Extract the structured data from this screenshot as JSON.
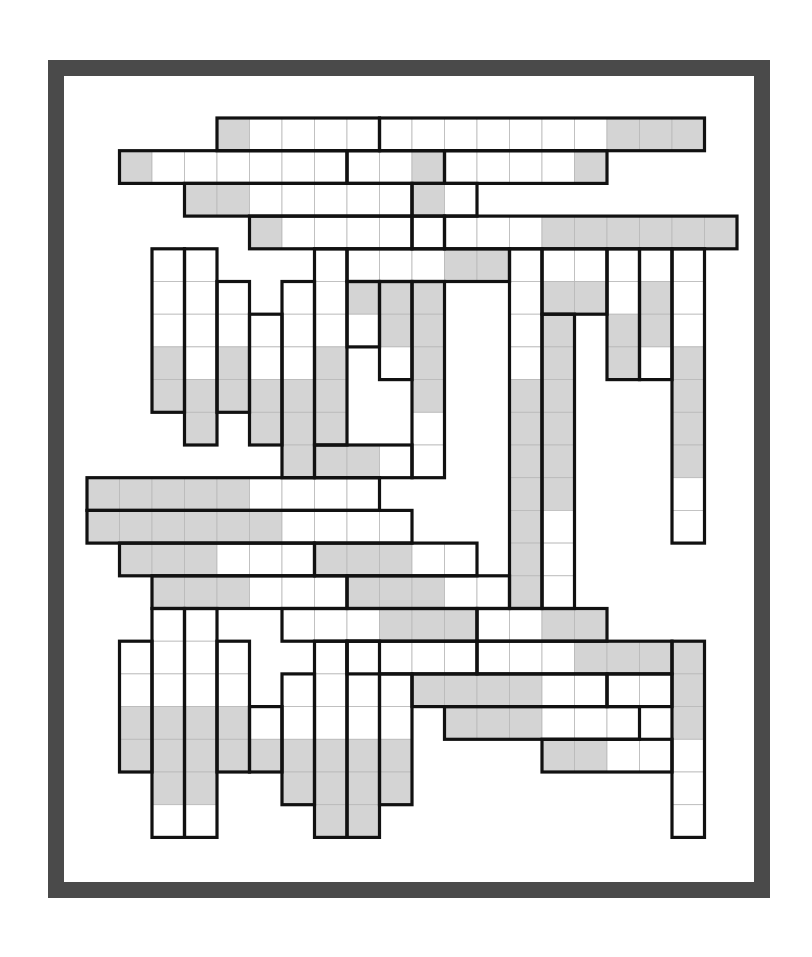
{
  "puzzle": {
    "title": "",
    "grid": {
      "origin_x": 87,
      "origin_y": 118,
      "cell_w": 32.5,
      "cell_h": 32.7
    },
    "colors": {
      "frame": "#4a4a4a",
      "shaded": "#d4d4d4",
      "empty": "#ffffff",
      "outline": "#111111",
      "gridline": "#b9b9b9"
    },
    "blocks": [
      {
        "c": 4,
        "r": 0,
        "w": 5,
        "h": 1,
        "shaded": [
          [
            4,
            0
          ]
        ]
      },
      {
        "c": 9,
        "r": 0,
        "w": 10,
        "h": 1,
        "shaded": [
          [
            16,
            0
          ],
          [
            17,
            0
          ],
          [
            18,
            0
          ]
        ]
      },
      {
        "c": 1,
        "r": 1,
        "w": 7,
        "h": 1,
        "shaded": [
          [
            1,
            1
          ]
        ]
      },
      {
        "c": 8,
        "r": 1,
        "w": 3,
        "h": 1,
        "shaded": [
          [
            10,
            1
          ]
        ]
      },
      {
        "c": 11,
        "r": 1,
        "w": 5,
        "h": 1,
        "shaded": [
          [
            15,
            1
          ]
        ]
      },
      {
        "c": 3,
        "r": 2,
        "w": 7,
        "h": 1,
        "shaded": [
          [
            3,
            2
          ],
          [
            4,
            2
          ]
        ]
      },
      {
        "c": 10,
        "r": 2,
        "w": 2,
        "h": 1,
        "shaded": [
          [
            10,
            2
          ]
        ]
      },
      {
        "c": 5,
        "r": 3,
        "w": 5,
        "h": 1,
        "shaded": [
          [
            5,
            3
          ]
        ]
      },
      {
        "c": 10,
        "r": 3,
        "w": 1,
        "h": 1,
        "shaded": []
      },
      {
        "c": 11,
        "r": 3,
        "w": 9,
        "h": 1,
        "shaded": [
          [
            14,
            3
          ],
          [
            15,
            3
          ],
          [
            16,
            3
          ],
          [
            17,
            3
          ],
          [
            18,
            3
          ],
          [
            19,
            3
          ]
        ]
      },
      {
        "c": 2,
        "r": 4,
        "w": 1,
        "h": 5,
        "shaded": [
          [
            2,
            7
          ],
          [
            2,
            8
          ]
        ]
      },
      {
        "c": 3,
        "r": 4,
        "w": 1,
        "h": 6,
        "shaded": [
          [
            3,
            8
          ],
          [
            3,
            9
          ]
        ]
      },
      {
        "c": 4,
        "r": 5,
        "w": 1,
        "h": 4,
        "shaded": [
          [
            4,
            7
          ],
          [
            4,
            8
          ]
        ]
      },
      {
        "c": 5,
        "r": 6,
        "w": 1,
        "h": 4,
        "shaded": [
          [
            5,
            8
          ],
          [
            5,
            9
          ]
        ]
      },
      {
        "c": 6,
        "r": 5,
        "w": 1,
        "h": 6,
        "shaded": [
          [
            6,
            8
          ],
          [
            6,
            9
          ],
          [
            6,
            10
          ]
        ]
      },
      {
        "c": 7,
        "r": 4,
        "w": 1,
        "h": 6,
        "shaded": [
          [
            7,
            7
          ],
          [
            7,
            8
          ],
          [
            7,
            9
          ]
        ]
      },
      {
        "c": 8,
        "r": 4,
        "w": 5,
        "h": 1,
        "shaded": [
          [
            11,
            4
          ],
          [
            12,
            4
          ]
        ]
      },
      {
        "c": 8,
        "r": 5,
        "w": 1,
        "h": 2,
        "shaded": [
          [
            8,
            5
          ]
        ]
      },
      {
        "c": 9,
        "r": 5,
        "w": 1,
        "h": 3,
        "shaded": [
          [
            9,
            5
          ],
          [
            9,
            6
          ]
        ]
      },
      {
        "c": 10,
        "r": 5,
        "w": 1,
        "h": 6,
        "shaded": [
          [
            10,
            5
          ],
          [
            10,
            6
          ],
          [
            10,
            7
          ],
          [
            10,
            8
          ]
        ]
      },
      {
        "c": 7,
        "r": 10,
        "w": 3,
        "h": 1,
        "shaded": [
          [
            7,
            10
          ],
          [
            8,
            10
          ]
        ]
      },
      {
        "c": 13,
        "r": 4,
        "w": 1,
        "h": 11,
        "shaded": [
          [
            13,
            8
          ],
          [
            13,
            9
          ],
          [
            13,
            10
          ],
          [
            13,
            11
          ],
          [
            13,
            12
          ],
          [
            13,
            13
          ],
          [
            13,
            14
          ]
        ]
      },
      {
        "c": 14,
        "r": 4,
        "w": 2,
        "h": 2,
        "shaded": [
          [
            14,
            5
          ],
          [
            15,
            5
          ]
        ]
      },
      {
        "c": 14,
        "r": 6,
        "w": 1,
        "h": 9,
        "shaded": [
          [
            14,
            6
          ],
          [
            14,
            7
          ],
          [
            14,
            8
          ],
          [
            14,
            9
          ],
          [
            14,
            10
          ],
          [
            14,
            11
          ]
        ]
      },
      {
        "c": 16,
        "r": 4,
        "w": 1,
        "h": 4,
        "shaded": [
          [
            16,
            6
          ],
          [
            16,
            7
          ]
        ]
      },
      {
        "c": 17,
        "r": 4,
        "w": 1,
        "h": 4,
        "shaded": [
          [
            17,
            5
          ],
          [
            17,
            6
          ]
        ]
      },
      {
        "c": 18,
        "r": 4,
        "w": 1,
        "h": 9,
        "shaded": [
          [
            18,
            7
          ],
          [
            18,
            8
          ],
          [
            18,
            9
          ],
          [
            18,
            10
          ]
        ]
      },
      {
        "c": 0,
        "r": 11,
        "w": 9,
        "h": 1,
        "shaded": [
          [
            0,
            11
          ],
          [
            1,
            11
          ],
          [
            2,
            11
          ],
          [
            3,
            11
          ],
          [
            4,
            11
          ]
        ]
      },
      {
        "c": 0,
        "r": 12,
        "w": 10,
        "h": 1,
        "shaded": [
          [
            0,
            12
          ],
          [
            1,
            12
          ],
          [
            2,
            12
          ],
          [
            3,
            12
          ],
          [
            4,
            12
          ],
          [
            5,
            12
          ]
        ]
      },
      {
        "c": 1,
        "r": 13,
        "w": 6,
        "h": 1,
        "shaded": [
          [
            1,
            13
          ],
          [
            2,
            13
          ],
          [
            3,
            13
          ]
        ]
      },
      {
        "c": 7,
        "r": 13,
        "w": 5,
        "h": 1,
        "shaded": [
          [
            7,
            13
          ],
          [
            8,
            13
          ],
          [
            9,
            13
          ]
        ]
      },
      {
        "c": 2,
        "r": 14,
        "w": 6,
        "h": 1,
        "shaded": [
          [
            2,
            14
          ],
          [
            3,
            14
          ],
          [
            4,
            14
          ]
        ]
      },
      {
        "c": 8,
        "r": 14,
        "w": 5,
        "h": 1,
        "shaded": [
          [
            8,
            14
          ],
          [
            9,
            14
          ],
          [
            10,
            14
          ]
        ]
      },
      {
        "c": 6,
        "r": 15,
        "w": 6,
        "h": 1,
        "shaded": [
          [
            9,
            15
          ],
          [
            10,
            15
          ],
          [
            11,
            15
          ]
        ]
      },
      {
        "c": 12,
        "r": 15,
        "w": 4,
        "h": 1,
        "shaded": [
          [
            14,
            15
          ],
          [
            15,
            15
          ]
        ]
      },
      {
        "c": 8,
        "r": 16,
        "w": 4,
        "h": 1,
        "shaded": []
      },
      {
        "c": 12,
        "r": 16,
        "w": 6,
        "h": 1,
        "shaded": [
          [
            15,
            16
          ],
          [
            16,
            16
          ],
          [
            17,
            16
          ]
        ]
      },
      {
        "c": 18,
        "r": 16,
        "w": 1,
        "h": 6,
        "shaded": [
          [
            18,
            16
          ],
          [
            18,
            17
          ],
          [
            18,
            18
          ]
        ]
      },
      {
        "c": 10,
        "r": 17,
        "w": 6,
        "h": 1,
        "shaded": [
          [
            10,
            17
          ],
          [
            11,
            17
          ],
          [
            12,
            17
          ],
          [
            13,
            17
          ]
        ]
      },
      {
        "c": 16,
        "r": 17,
        "w": 2,
        "h": 1,
        "shaded": []
      },
      {
        "c": 11,
        "r": 18,
        "w": 6,
        "h": 1,
        "shaded": [
          [
            11,
            18
          ],
          [
            12,
            18
          ],
          [
            13,
            18
          ]
        ]
      },
      {
        "c": 14,
        "r": 19,
        "w": 4,
        "h": 1,
        "shaded": [
          [
            14,
            19
          ],
          [
            15,
            19
          ]
        ]
      },
      {
        "c": 1,
        "r": 16,
        "w": 1,
        "h": 4,
        "shaded": [
          [
            1,
            18
          ],
          [
            1,
            19
          ]
        ]
      },
      {
        "c": 2,
        "r": 15,
        "w": 1,
        "h": 7,
        "shaded": [
          [
            2,
            18
          ],
          [
            2,
            19
          ],
          [
            2,
            20
          ]
        ]
      },
      {
        "c": 3,
        "r": 15,
        "w": 1,
        "h": 7,
        "shaded": [
          [
            3,
            18
          ],
          [
            3,
            19
          ],
          [
            3,
            20
          ]
        ]
      },
      {
        "c": 4,
        "r": 16,
        "w": 1,
        "h": 4,
        "shaded": [
          [
            4,
            18
          ],
          [
            4,
            19
          ]
        ]
      },
      {
        "c": 5,
        "r": 18,
        "w": 1,
        "h": 2,
        "shaded": [
          [
            5,
            19
          ]
        ]
      },
      {
        "c": 6,
        "r": 17,
        "w": 1,
        "h": 4,
        "shaded": [
          [
            6,
            19
          ],
          [
            6,
            20
          ]
        ]
      },
      {
        "c": 7,
        "r": 16,
        "w": 1,
        "h": 6,
        "shaded": [
          [
            7,
            19
          ],
          [
            7,
            20
          ],
          [
            7,
            21
          ]
        ]
      },
      {
        "c": 8,
        "r": 16,
        "w": 1,
        "h": 6,
        "shaded": [
          [
            8,
            19
          ],
          [
            8,
            20
          ],
          [
            8,
            21
          ]
        ]
      },
      {
        "c": 9,
        "r": 17,
        "w": 1,
        "h": 4,
        "shaded": [
          [
            9,
            19
          ],
          [
            9,
            20
          ]
        ]
      }
    ]
  }
}
